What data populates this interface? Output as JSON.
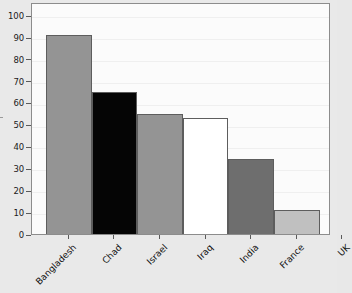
{
  "chart_data": {
    "type": "bar",
    "title": "",
    "subtitle": "",
    "xlabel": "",
    "ylabel": "",
    "categories": [
      "Bangladesh",
      "Chad",
      "Israel",
      "Iraq",
      "India",
      "France",
      "UK"
    ],
    "values": [
      91,
      65,
      55,
      53,
      34.5,
      11,
      0
    ],
    "series": [
      {
        "name": "",
        "values": [
          91,
          65,
          55,
          53,
          34.5,
          11,
          0
        ]
      }
    ],
    "bar_colors": [
      "#949494",
      "#050505",
      "#949494",
      "#ffffff",
      "#6e6e6e",
      "#c0c0c0",
      "#fbfbfb"
    ],
    "bar_edge_color": "#5d5d5d",
    "ylim": [
      0,
      106
    ],
    "yticks": [
      0,
      10,
      20,
      30,
      40,
      50,
      60,
      70,
      80,
      90,
      100
    ],
    "ytick_labels": [
      "0",
      "10",
      "20",
      "30",
      "40",
      "50",
      "60",
      "70",
      "80",
      "90",
      "100"
    ],
    "xtick_labels": [
      "Bangladesh",
      "Chad",
      "Israel",
      "Iraq",
      "India",
      "France",
      "UK"
    ],
    "xtick_rotation": -45,
    "grid": true,
    "grid_axis": "y",
    "legend": false,
    "legend_position": "none",
    "plot_background": "#fbfbfb",
    "figure_background": "#e9e9e9",
    "frame_color": "#8c8c8c",
    "annotations": []
  }
}
